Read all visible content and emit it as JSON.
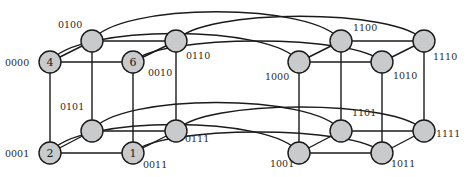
{
  "diagram": {
    "nodes": [
      {
        "id": "0000",
        "label": "0000",
        "number": "4",
        "x": 50,
        "y": 62,
        "lx": 5,
        "ly": 66
      },
      {
        "id": "0100",
        "label": "0100",
        "number": "",
        "x": 92,
        "y": 41,
        "lx": 58,
        "ly": 28
      },
      {
        "id": "0010",
        "label": "0010",
        "number": "6",
        "x": 133,
        "y": 62,
        "lx": 148,
        "ly": 76
      },
      {
        "id": "0110",
        "label": "0110",
        "number": "",
        "x": 176,
        "y": 41,
        "lx": 186,
        "ly": 59
      },
      {
        "id": "1000",
        "label": "1000",
        "number": "",
        "x": 299,
        "y": 62,
        "lx": 265,
        "ly": 80
      },
      {
        "id": "1100",
        "label": "1100",
        "number": "",
        "x": 341,
        "y": 41,
        "lx": 353,
        "ly": 31
      },
      {
        "id": "1010",
        "label": "1010",
        "number": "",
        "x": 382,
        "y": 62,
        "lx": 393,
        "ly": 79
      },
      {
        "id": "1110",
        "label": "1110",
        "number": "",
        "x": 424,
        "y": 41,
        "lx": 433,
        "ly": 60
      },
      {
        "id": "0001",
        "label": "0001",
        "number": "2",
        "x": 50,
        "y": 153,
        "lx": 5,
        "ly": 157
      },
      {
        "id": "0101",
        "label": "0101",
        "number": "",
        "x": 92,
        "y": 131,
        "lx": 60,
        "ly": 110
      },
      {
        "id": "0011",
        "label": "0011",
        "number": "1",
        "x": 133,
        "y": 153,
        "lx": 143,
        "ly": 168
      },
      {
        "id": "0111",
        "label": "0111",
        "number": "",
        "x": 176,
        "y": 131,
        "lx": 185,
        "ly": 142
      },
      {
        "id": "1001",
        "label": "1001",
        "number": "",
        "x": 299,
        "y": 153,
        "lx": 270,
        "ly": 167
      },
      {
        "id": "1101",
        "label": "1101",
        "number": "",
        "x": 341,
        "y": 131,
        "lx": 352,
        "ly": 116
      },
      {
        "id": "1011",
        "label": "1011",
        "number": "",
        "x": 382,
        "y": 153,
        "lx": 391,
        "ly": 167
      },
      {
        "id": "1111",
        "label": "1111",
        "number": "",
        "x": 424,
        "y": 131,
        "lx": 436,
        "ly": 137
      }
    ],
    "edges": [
      [
        "0000",
        "0010"
      ],
      [
        "0000",
        "0100"
      ],
      [
        "0100",
        "0110"
      ],
      [
        "0010",
        "0110"
      ],
      [
        "0000",
        "0001"
      ],
      [
        "0100",
        "0101"
      ],
      [
        "0010",
        "0011"
      ],
      [
        "0110",
        "0111"
      ],
      [
        "0001",
        "0011"
      ],
      [
        "0001",
        "0101"
      ],
      [
        "0101",
        "0111"
      ],
      [
        "0011",
        "0111"
      ],
      [
        "1000",
        "1010"
      ],
      [
        "1000",
        "1100"
      ],
      [
        "1100",
        "1110"
      ],
      [
        "1010",
        "1110"
      ],
      [
        "1000",
        "1001"
      ],
      [
        "1100",
        "1101"
      ],
      [
        "1010",
        "1011"
      ],
      [
        "1110",
        "1111"
      ],
      [
        "1001",
        "1011"
      ],
      [
        "1001",
        "1101"
      ],
      [
        "1101",
        "1111"
      ],
      [
        "1011",
        "1111"
      ]
    ],
    "arcs": [
      {
        "from": "0100",
        "to": "1100",
        "cy": 2
      },
      {
        "from": "0110",
        "to": "1110",
        "cy": 8
      },
      {
        "from": "0000",
        "to": "1000",
        "cy": 24
      },
      {
        "from": "0010",
        "to": "1010",
        "cy": 34
      },
      {
        "from": "0101",
        "to": "1101",
        "cy": 93
      },
      {
        "from": "0111",
        "to": "1111",
        "cy": 99
      },
      {
        "from": "0001",
        "to": "1001",
        "cy": 115
      },
      {
        "from": "0011",
        "to": "1011",
        "cy": 125
      }
    ]
  }
}
